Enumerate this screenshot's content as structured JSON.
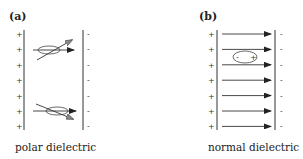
{
  "panels": [
    {
      "label": "(a)",
      "caption": "polar dielectric",
      "left_plate_sign": "+",
      "right_plate_sign": "-",
      "charge_count": 7,
      "molecules": [
        {
          "orientation": "tilted-up",
          "field_arrow": true
        },
        {
          "orientation": "tilted-down",
          "field_arrow": true
        }
      ]
    },
    {
      "label": "(b)",
      "caption": "normal dielectric",
      "left_plate_sign": "+",
      "right_plate_sign": "-",
      "charge_count": 7,
      "field_line_count": 7,
      "dipole": {
        "neg": "-",
        "pos": "+"
      }
    }
  ]
}
